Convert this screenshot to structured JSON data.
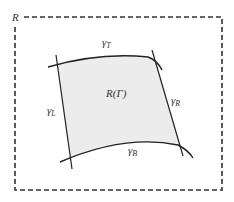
{
  "diagram": {
    "outer_region_label": "R",
    "inner_region_label": "R(Γ)",
    "curves": {
      "top": {
        "symbol": "γ",
        "subscript": "T"
      },
      "bottom": {
        "symbol": "γ",
        "subscript": "B"
      },
      "left": {
        "symbol": "γ",
        "subscript": "L"
      },
      "right": {
        "symbol": "γ",
        "subscript": "R"
      }
    },
    "colors": {
      "region_fill": "#ececec",
      "stroke": "#222222",
      "dashed_border": "#333333",
      "text": "#333333"
    }
  }
}
